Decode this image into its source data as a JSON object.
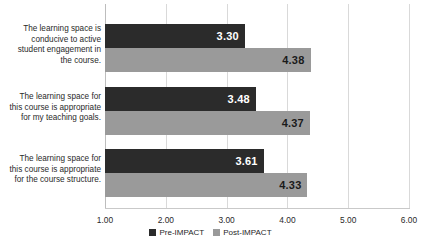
{
  "chart_data": {
    "type": "bar",
    "orientation": "horizontal",
    "title": "",
    "subtitle": "",
    "xlabel": "",
    "ylabel": "",
    "xlim": [
      1.0,
      6.0
    ],
    "xticks": [
      "1.00",
      "2.00",
      "3.00",
      "4.00",
      "5.00",
      "6.00"
    ],
    "xtick_values": [
      1.0,
      2.0,
      3.0,
      4.0,
      5.0,
      6.0
    ],
    "grid": "vertical",
    "legend_position": "bottom-center",
    "categories": [
      "The learning space is conducive to active student engagement in the course.",
      "The learning space for this course is appropriate for my teaching goals.",
      "The learning space for this course is appropriate for the course structure."
    ],
    "category_lines": [
      [
        "The learning space is",
        "conducive to active",
        "student engagement in",
        "the course."
      ],
      [
        "The learning space for",
        "this course is appropriate",
        "for my teaching goals."
      ],
      [
        "The learning space for",
        "this course is appropriate",
        "for the course structure."
      ]
    ],
    "series": [
      {
        "name": "Pre-IMPACT",
        "color": "#2b2b2b",
        "values": [
          3.3,
          3.48,
          3.61
        ],
        "labels": [
          "3.30",
          "3.48",
          "3.61"
        ]
      },
      {
        "name": "Post-IMPACT",
        "color": "#9a9a9a",
        "values": [
          4.38,
          4.37,
          4.33
        ],
        "labels": [
          "4.38",
          "4.37",
          "4.33"
        ]
      }
    ]
  },
  "legend": {
    "items": [
      {
        "label": "Pre-IMPACT",
        "color": "#2b2b2b"
      },
      {
        "label": "Post-IMPACT",
        "color": "#9a9a9a"
      }
    ]
  },
  "axis": {
    "tick_labels": [
      "1.00",
      "2.00",
      "3.00",
      "4.00",
      "5.00",
      "6.00"
    ]
  }
}
